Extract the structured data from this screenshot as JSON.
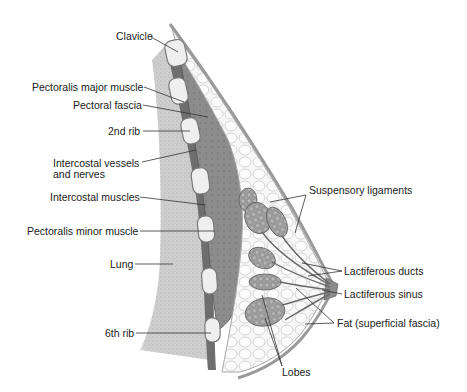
{
  "diagram": {
    "colors": {
      "background": "#ffffff",
      "text": "#222222",
      "leader_line": "#333333",
      "lung": "#c9c9c9",
      "muscle": "#8a8a8a",
      "rib_fill": "#eeeeee",
      "rib_stroke": "#777777",
      "fat_lobule": "#f4f4f4",
      "gland_lobe": "#9a9a9a",
      "skin": "#b5b5b5"
    },
    "labels_left": [
      {
        "id": "clavicle",
        "text": "Clavicle"
      },
      {
        "id": "pectoralis-major",
        "text": "Pectoralis major muscle"
      },
      {
        "id": "pectoral-fascia",
        "text": "Pectoral fascia"
      },
      {
        "id": "second-rib",
        "text": "2nd rib"
      },
      {
        "id": "intercostal-vessels-1",
        "text": "Intercostal vessels"
      },
      {
        "id": "intercostal-vessels-2",
        "text": "and nerves"
      },
      {
        "id": "intercostal-muscles",
        "text": "Intercostal muscles"
      },
      {
        "id": "pectoralis-minor",
        "text": "Pectoralis minor muscle"
      },
      {
        "id": "lung",
        "text": "Lung"
      },
      {
        "id": "sixth-rib",
        "text": "6th rib"
      }
    ],
    "labels_right": [
      {
        "id": "suspensory-ligaments",
        "text": "Suspensory ligaments"
      },
      {
        "id": "lactiferous-ducts",
        "text": "Lactiferous ducts"
      },
      {
        "id": "lactiferous-sinus",
        "text": "Lactiferous sinus"
      },
      {
        "id": "fat",
        "text": "Fat (superficial fascia)"
      },
      {
        "id": "lobes",
        "text": "Lobes"
      }
    ]
  }
}
